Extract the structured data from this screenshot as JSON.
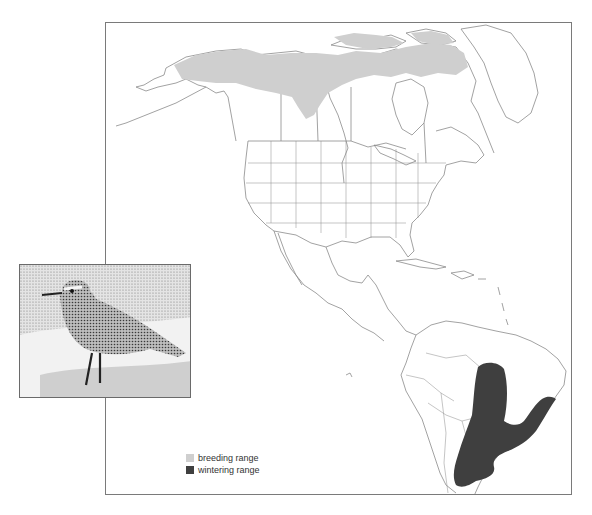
{
  "page": {
    "header_text_visible": false
  },
  "map": {
    "region": "North and South America",
    "colors": {
      "breeding": "#cfcfcf",
      "wintering": "#3f3f3f",
      "borders": "#8a8a8a",
      "frame": "#7a7a7a"
    }
  },
  "legend": {
    "items": [
      {
        "label": "breeding range",
        "color": "#cfcfcf"
      },
      {
        "label": "wintering range",
        "color": "#3f3f3f"
      }
    ]
  },
  "inset": {
    "subject": "bird-illustration",
    "description": "stippled drawing of a shorebird (plover) standing on sand"
  }
}
